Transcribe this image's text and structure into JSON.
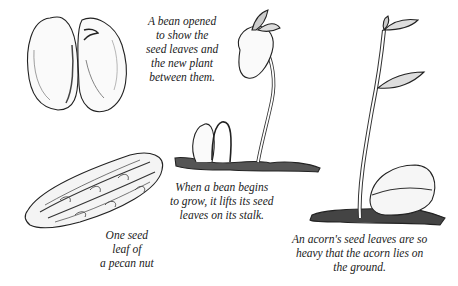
{
  "figure": {
    "captions": {
      "bean_opened": {
        "lines": [
          "A bean opened",
          "to show the",
          "seed leaves and",
          "the new plant",
          "between them."
        ]
      },
      "bean_grows": {
        "lines": [
          "When a bean begins",
          "to grow, it lifts its seed",
          "leaves on its stalk."
        ]
      },
      "pecan": {
        "lines": [
          "One seed",
          "leaf of",
          "a pecan nut"
        ]
      },
      "acorn": {
        "lines": [
          "An acorn's seed leaves are so",
          "heavy that the acorn lies on",
          "the ground."
        ]
      }
    },
    "illustrations": [
      {
        "id": "opened-bean",
        "label": "opened bean"
      },
      {
        "id": "pecan-seed-leaf",
        "label": "pecan seed leaf"
      },
      {
        "id": "sprouting-bean",
        "label": "sprouting bean"
      },
      {
        "id": "acorn-seedling",
        "label": "acorn seedling"
      }
    ],
    "colors": {
      "ink": "#1a1a1a",
      "shade": "#555555",
      "paper": "#ffffff"
    }
  }
}
